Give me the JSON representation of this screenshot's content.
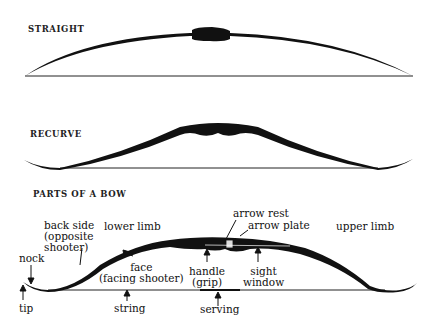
{
  "diagrams": {
    "straight": {
      "title": "STRAIGHT"
    },
    "recurve": {
      "title": "RECURVE"
    },
    "parts": {
      "title": "PARTS OF A BOW",
      "labels": {
        "back_side_1": "back side",
        "back_side_2": "(opposite",
        "back_side_3": "shooter)",
        "lower_limb": "lower limb",
        "nock": "nock",
        "tip": "tip",
        "face_1": "face",
        "face_2": "(facing shooter)",
        "string": "string",
        "arrow_rest": "arrow rest",
        "arrow_plate": "arrow plate",
        "upper_limb": "upper limb",
        "handle_1": "handle",
        "handle_2": "(grip)",
        "sight_1": "sight",
        "sight_2": "window",
        "serving": "serving"
      }
    }
  },
  "colors": {
    "ink": "#111111",
    "background": "#ffffff"
  }
}
